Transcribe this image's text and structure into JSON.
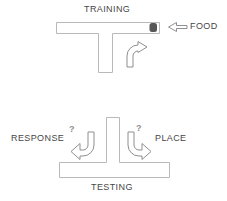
{
  "colors": {
    "background": "#ffffff",
    "text": "#464646",
    "maze_outline": "#b9b9b9",
    "arrow_outline": "#8f8f8f",
    "food_fill": "#575757"
  },
  "training": {
    "title": "TRAINING",
    "food_label": "FOOD"
  },
  "testing": {
    "title": "TESTING",
    "left_label": "RESPONSE",
    "right_label": "PLACE",
    "left_question_mark": "?",
    "right_question_mark": "?"
  }
}
